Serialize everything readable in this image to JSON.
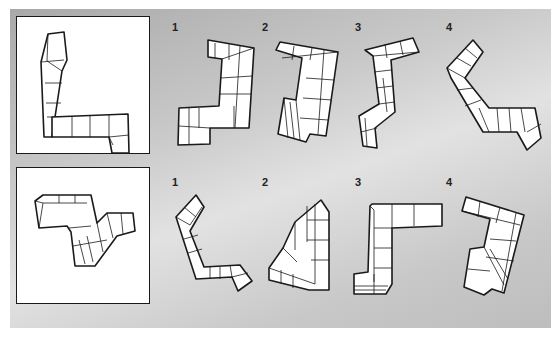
{
  "puzzle": {
    "rows": [
      {
        "id": "row-1",
        "reference_figure": "L-shaped cube chain (reference)",
        "options": [
          {
            "label": "1"
          },
          {
            "label": "2"
          },
          {
            "label": "3"
          },
          {
            "label": "4"
          }
        ]
      },
      {
        "id": "row-2",
        "reference_figure": "Z-shaped cube chain (reference)",
        "options": [
          {
            "label": "1"
          },
          {
            "label": "2"
          },
          {
            "label": "3"
          },
          {
            "label": "4"
          }
        ]
      }
    ],
    "colors": {
      "background": "#c9c9c9",
      "box_border": "#1a1a1a",
      "cube_fill": "#ffffff"
    }
  }
}
